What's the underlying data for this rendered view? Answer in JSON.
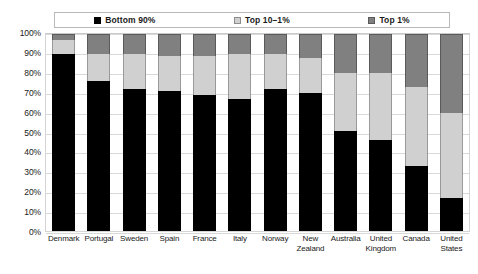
{
  "chart_data": {
    "type": "bar",
    "subtype": "stacked-bar-100-percent",
    "title": "",
    "xlabel": "",
    "ylabel": "",
    "ylim": [
      0,
      100
    ],
    "grid": true,
    "legend_position": "top",
    "categories": [
      "Denmark",
      "Portugal",
      "Sweden",
      "Spain",
      "France",
      "Italy",
      "Norway",
      "New Zealand",
      "Australia",
      "United Kingdom",
      "Canada",
      "United States"
    ],
    "tick_labels": [
      "0%",
      "10%",
      "20%",
      "30%",
      "40%",
      "50%",
      "60%",
      "70%",
      "80%",
      "90%",
      "100%"
    ],
    "tick_values": [
      0,
      10,
      20,
      30,
      40,
      50,
      60,
      70,
      80,
      90,
      100
    ],
    "series": [
      {
        "name": "Bottom 90%",
        "color": "#000000",
        "values": [
          90,
          76,
          72,
          71,
          69,
          67,
          72,
          70,
          51,
          46,
          33,
          17
        ]
      },
      {
        "name": "Top 10–1%",
        "color": "#d0d0d0",
        "values": [
          7,
          14,
          18,
          18,
          20,
          23,
          18,
          18,
          29,
          34,
          40,
          43
        ]
      },
      {
        "name": "Top 1%",
        "color": "#808080",
        "values": [
          3,
          10,
          10,
          11,
          11,
          10,
          10,
          12,
          20,
          20,
          27,
          40
        ]
      }
    ]
  },
  "legend": {
    "items": [
      {
        "label": "Bottom 90%",
        "swatch_name": "legend-swatch-bottom-90",
        "color": "#000000"
      },
      {
        "label": "Top 10–1%",
        "swatch_name": "legend-swatch-top-10-1",
        "color": "#d0d0d0"
      },
      {
        "label": "Top 1%",
        "swatch_name": "legend-swatch-top-1",
        "color": "#808080"
      }
    ]
  }
}
